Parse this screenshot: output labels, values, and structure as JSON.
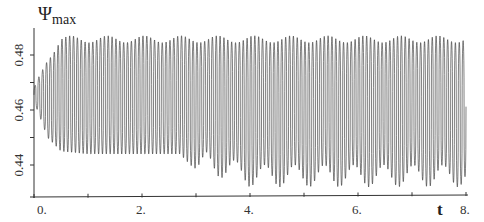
{
  "chart_data": {
    "type": "line",
    "title": "",
    "xlabel": "t",
    "ylabel": "ψmax",
    "ylabel_main": "Ψ",
    "ylabel_sub": "max",
    "xlim": [
      0,
      8
    ],
    "ylim": [
      0.429,
      0.49
    ],
    "grid": false,
    "legend": null,
    "x_ticks": [
      0,
      1,
      2,
      3,
      4,
      5,
      6,
      7,
      8
    ],
    "x_tick_labels": [
      {
        "value": 0,
        "label": "0."
      },
      {
        "value": 2,
        "label": "2."
      },
      {
        "value": 4,
        "label": "4."
      },
      {
        "value": 6,
        "label": "6."
      },
      {
        "value": 8,
        "label": "8."
      }
    ],
    "y_ticks": [
      0.44,
      0.45,
      0.46,
      0.47,
      0.48
    ],
    "y_tick_labels": [
      {
        "value": 0.48,
        "label": "0.48"
      },
      {
        "value": 0.46,
        "label": "0.46"
      },
      {
        "value": 0.44,
        "label": "0.44"
      }
    ],
    "series": [
      {
        "name": "psi_max",
        "description": "Rapid oscillation (~14 cycles per unit t) with slow beat modulation; amplitude grows from t=0 to ~0.5, steady band 0.444–0.487 until t≈3, then lower envelope dips to ~0.432 with beats of period ~0.55",
        "oscillation_frequency": 14,
        "start_value": 0.464,
        "envelope": {
          "t": [
            0.0,
            0.1,
            0.25,
            0.5,
            1.0,
            2.0,
            2.7,
            3.0,
            4.0,
            5.0,
            6.0,
            7.0,
            8.0
          ],
          "upper": [
            0.468,
            0.473,
            0.48,
            0.487,
            0.487,
            0.487,
            0.487,
            0.487,
            0.487,
            0.487,
            0.487,
            0.487,
            0.487
          ],
          "lower": [
            0.463,
            0.458,
            0.45,
            0.445,
            0.444,
            0.444,
            0.444,
            0.438,
            0.432,
            0.432,
            0.432,
            0.432,
            0.432
          ]
        },
        "upper_beat": {
          "period": 0.68,
          "depth": 0.0025
        },
        "lower_beat": {
          "period": 0.55,
          "depth": 0.008,
          "start_t": 2.9
        }
      }
    ]
  },
  "labels": {
    "y_main": "Ψ",
    "y_sub": "max",
    "x_axis": "t",
    "x_ticks": [
      "0.",
      "2.",
      "4.",
      "6.",
      "8."
    ],
    "y_ticks": [
      "0.48",
      "0.46",
      "0.44"
    ]
  },
  "colors": {
    "line": "#2b2b2b",
    "axis": "#333333",
    "background": "#ffffff"
  }
}
